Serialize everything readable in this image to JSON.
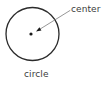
{
  "figure": {
    "kind": "geometry-diagram",
    "width": 104,
    "height": 88,
    "background_color": "#ffffff"
  },
  "colors": {
    "stroke": "#2b2b2b",
    "leader_line": "#7c7c7c",
    "dot": "#1a1a1a",
    "text": "#3b3b3b"
  },
  "shapes": {
    "circle": {
      "name": "circle",
      "cx": 32.5,
      "cy": 34,
      "r": 26.5,
      "stroke_width": 1.3,
      "fill": "none"
    },
    "center_dot": {
      "name": "center",
      "cx": 31,
      "cy": 34,
      "r": 1.6
    },
    "leader": {
      "from_x": 70,
      "from_y": 10.5,
      "to_x": 36,
      "to_y": 31.6,
      "stroke_width": 0.8,
      "arrowhead": true
    }
  },
  "labels": {
    "center": "center",
    "circle": "circle"
  }
}
